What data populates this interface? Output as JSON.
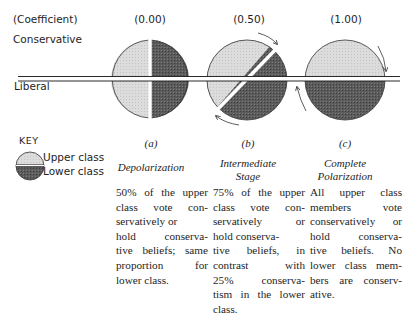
{
  "header": {
    "coefficient_label": "(Coefficient)",
    "coefficients": [
      "(0.00)",
      "(0.50)",
      "(1.00)"
    ]
  },
  "axis": {
    "top_label": "Conservative",
    "bottom_label": "Liberal"
  },
  "key": {
    "title": "KEY",
    "items": [
      {
        "label": "Upper class",
        "shade": "light",
        "color": "#d8d8d8"
      },
      {
        "label": "Lower class",
        "shade": "dark",
        "color": "#585858"
      }
    ]
  },
  "colors": {
    "upper_class": "#d9d9d9",
    "lower_class": "#5a5a5a",
    "line": "#2a2a2a"
  },
  "panels": [
    {
      "letter": "(a)",
      "title_lines": [
        "Depolarization"
      ],
      "coefficient": 0.0,
      "description_lines": [
        "50% of the upper",
        "class vote con-",
        "servatively or",
        "hold conserva-",
        "tive beliefs; same",
        "proportion for",
        "lower class."
      ]
    },
    {
      "letter": "(b)",
      "title_lines": [
        "Intermediate",
        "Stage"
      ],
      "coefficient": 0.5,
      "description_lines": [
        "75% of the upper",
        "class vote con-",
        "servatively or",
        "hold conserva-",
        "tive beliefs, in",
        "contrast with",
        "25% conserva-",
        "tism in the lower",
        "class."
      ]
    },
    {
      "letter": "(c)",
      "title_lines": [
        "Complete",
        "Polarization"
      ],
      "coefficient": 1.0,
      "description_lines": [
        "All upper class",
        "members vote",
        "conservatively or",
        "hold conserva-",
        "tive beliefs. No",
        "lower class mem-",
        "bers are conserv-",
        "ative."
      ]
    }
  ]
}
